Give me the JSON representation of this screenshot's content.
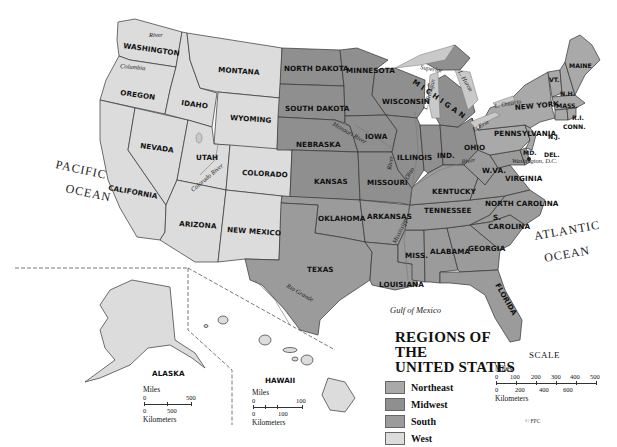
{
  "map": {
    "title_line1": "REGIONS OF THE",
    "title_line2": "UNITED STATES",
    "legend": [
      {
        "label": "Northeast",
        "color": "#a9a9a9"
      },
      {
        "label": "Midwest",
        "color": "#8f8f8f"
      },
      {
        "label": "South",
        "color": "#9b9b9b"
      },
      {
        "label": "West",
        "color": "#dcdcdc"
      }
    ],
    "states": {
      "washington": "WASHINGTON",
      "oregon": "OREGON",
      "california": "CALIFORNIA",
      "nevada": "NEVADA",
      "idaho": "IDAHO",
      "montana": "MONTANA",
      "wyoming": "WYOMING",
      "utah": "UTAH",
      "colorado": "COLORADO",
      "arizona": "ARIZONA",
      "new_mexico": "NEW MEXICO",
      "north_dakota": "NORTH DAKOTA",
      "south_dakota": "SOUTH DAKOTA",
      "nebraska": "NEBRASKA",
      "kansas": "KANSAS",
      "minnesota": "MINNESOTA",
      "iowa": "IOWA",
      "missouri": "MISSOURI",
      "wisconsin": "WISCONSIN",
      "illinois": "ILLINOIS",
      "indiana": "IND.",
      "ohio": "OHIO",
      "michigan": "MICHIGAN",
      "oklahoma": "OKLAHOMA",
      "texas": "TEXAS",
      "arkansas": "ARKANSAS",
      "louisiana": "LOUISIANA",
      "mississippi": "MISS.",
      "alabama": "ALABAMA",
      "georgia": "GEORGIA",
      "florida": "FLORIDA",
      "tennessee": "TENNESSEE",
      "kentucky": "KENTUCKY",
      "west_virginia": "W.VA.",
      "virginia": "VIRGINIA",
      "north_carolina": "NORTH CAROLINA",
      "south_carolina_1": "S.",
      "south_carolina_2": "CAROLINA",
      "maryland": "MD.",
      "delaware": "DEL.",
      "pennsylvania": "PENNSYLVANIA",
      "new_york": "NEW YORK",
      "new_jersey": "N.J.",
      "connecticut": "CONN.",
      "rhode_island": "R.I.",
      "massachusetts": "MASS.",
      "vermont": "VT.",
      "new_hampshire": "N.H.",
      "maine": "MAINE",
      "alaska": "ALASKA",
      "hawaii": "HAWAII"
    },
    "places": {
      "dc": "Washington, D.C.",
      "pacific_1": "PACIFIC",
      "pacific_2": "OCEAN",
      "atlantic_1": "ATLANTIC",
      "atlantic_2": "OCEAN",
      "gulf": "Gulf of Mexico"
    },
    "rivers": {
      "snake": "River",
      "columbia": "Columbia",
      "colorado": "Colorado River",
      "missouri": "Missouri River",
      "mississippi": "Mississippi",
      "ohio_1": "Ohio",
      "ohio_2": "River",
      "rio_grande": "Rio Grande",
      "illinois_river": "River"
    },
    "lakes": {
      "superior": "Superior",
      "michigan": "L. Michigan",
      "huron": "L. Huron",
      "erie": "L. Erie",
      "ontario": "L. Ontario"
    },
    "scale_main": {
      "title": "SCALE",
      "miles_label": "Miles",
      "km_label": "Kilometers",
      "miles_ticks": [
        "0",
        "100",
        "200",
        "300",
        "400",
        "500"
      ],
      "km_ticks": [
        "0",
        "200",
        "400",
        "600"
      ]
    },
    "scale_alaska": {
      "miles_label": "Miles",
      "km_label": "Kilometers",
      "miles_ticks": [
        "0",
        "500"
      ],
      "km_ticks": [
        "0",
        "500"
      ]
    },
    "scale_hawaii": {
      "miles_label": "Miles",
      "km_label": "Kilometers",
      "miles_ticks": [
        "0",
        "100"
      ],
      "km_ticks": [
        "0",
        "100"
      ]
    },
    "copyright": "© FPC"
  }
}
